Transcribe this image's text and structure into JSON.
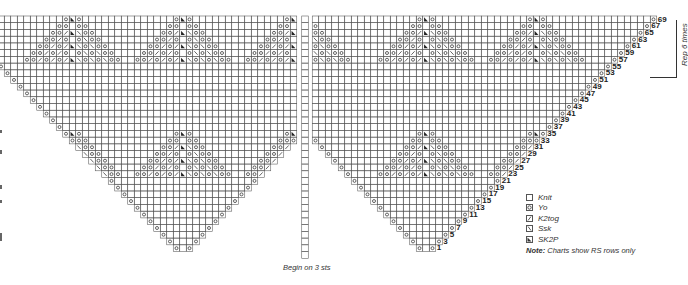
{
  "chart": {
    "cell_w": 6.5,
    "row_h": 6.73,
    "top_row_y": 16,
    "top_row": 69,
    "left_center_x": 183,
    "right_center_x": 426,
    "center_col_x": 305,
    "center_col_top": 16,
    "center_col_bottom": 258,
    "grid_color": "#555555",
    "rows_odd_from": 1,
    "rows_odd_to": 69
  },
  "row_labels": [
    "1",
    "3",
    "5",
    "7",
    "9",
    "11",
    "13",
    "15",
    "17",
    "19",
    "21",
    "23",
    "25",
    "27",
    "29",
    "31",
    "33",
    "35",
    "37",
    "39",
    "41",
    "43",
    "45",
    "47",
    "49",
    "51",
    "53",
    "55",
    "57",
    "59",
    "61",
    "63",
    "65",
    "67",
    "69"
  ],
  "repeat": {
    "label": "Rep 6 times",
    "from_row": 53,
    "to_row": 69
  },
  "begin_label": "Begin on 3 sts",
  "legend": {
    "items": [
      {
        "symbol": "knit",
        "label": "Knit"
      },
      {
        "symbol": "yo",
        "label": "Yo"
      },
      {
        "symbol": "k2tog",
        "label": "K2tog"
      },
      {
        "symbol": "ssk",
        "label": "Ssk"
      },
      {
        "symbol": "sk2p",
        "label": "SK2P"
      }
    ],
    "note_bold": "Note:",
    "note_text": " Charts show RS rows only"
  },
  "motifs": {
    "description": "Diamond lace motifs centered on SK2P stitches",
    "left_triangle_centers_x": [
      74,
      183,
      293
    ],
    "right_triangle_centers_x": [
      200,
      305,
      426,
      535
    ],
    "upper_band_top_row": 69,
    "lower_band_top_row": 35
  }
}
